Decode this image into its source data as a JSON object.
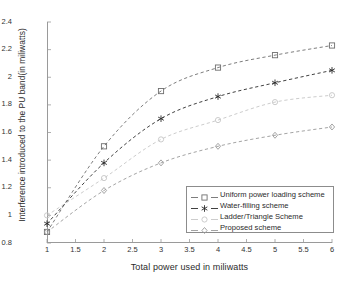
{
  "chart_data": {
    "type": "line",
    "title": "",
    "xlabel": "Total power used in miliwatts",
    "ylabel": "Interference introduced to the PU band(in miliwatts)",
    "x": [
      1,
      2,
      3,
      4,
      5,
      6
    ],
    "xlim": [
      1,
      6
    ],
    "ylim": [
      0.8,
      2.4
    ],
    "xticks": [
      "1",
      "1.5",
      "2",
      "2.5",
      "3",
      "3.5",
      "4",
      "4.5",
      "5",
      "5.5",
      "6"
    ],
    "xtick_values": [
      1,
      1.5,
      2,
      2.5,
      3,
      3.5,
      4,
      4.5,
      5,
      5.5,
      6
    ],
    "yticks": [
      "0.8",
      "1",
      "1.2",
      "1.4",
      "1.6",
      "1.8",
      "2",
      "2.2",
      "2.4"
    ],
    "ytick_values": [
      0.8,
      1,
      1.2,
      1.4,
      1.6,
      1.8,
      2,
      2.2,
      2.4
    ],
    "grid": false,
    "legend_position": "lower right (inside axes)",
    "linestyle": "dashed",
    "series": [
      {
        "name": "Uniform power loading scheme",
        "marker": "square",
        "color": "#6e6e6e",
        "values": [
          0.88,
          1.5,
          1.9,
          2.07,
          2.16,
          2.23
        ]
      },
      {
        "name": "Water-filling scheme",
        "marker": "asterisk",
        "color": "#2b2b2b",
        "values": [
          0.94,
          1.38,
          1.7,
          1.86,
          1.96,
          2.05
        ]
      },
      {
        "name": "Ladder/Triangle Scheme",
        "marker": "circle",
        "color": "#c6c6c6",
        "values": [
          1.0,
          1.27,
          1.55,
          1.69,
          1.82,
          1.87
        ]
      },
      {
        "name": "Proposed scheme",
        "marker": "diamond",
        "color": "#9a9a9a",
        "values": [
          0.88,
          1.18,
          1.38,
          1.5,
          1.58,
          1.64
        ]
      }
    ]
  },
  "legend": {
    "items": [
      {
        "label": "Uniform power loading scheme"
      },
      {
        "label": "Water-filling scheme"
      },
      {
        "label": "Ladder/Triangle Scheme"
      },
      {
        "label": "Proposed scheme"
      }
    ]
  },
  "axes": {
    "x_title": "Total power used in miliwatts",
    "y_title": "Interference introduced to the PU band(in miliwatts)"
  }
}
